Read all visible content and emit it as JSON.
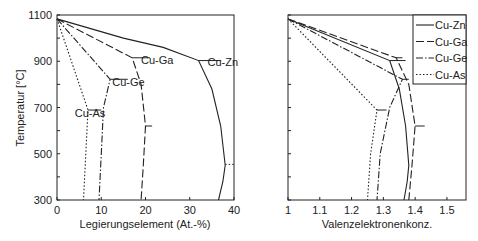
{
  "chart_data": [
    {
      "type": "line",
      "title": "",
      "xlabel": "Legierungselement (At.-%)",
      "ylabel": "Temperatur [°C]",
      "xlim": [
        0,
        40
      ],
      "ylim": [
        300,
        1100
      ],
      "xticks": [
        0,
        10,
        20,
        30,
        40
      ],
      "yticks": [
        300,
        500,
        700,
        900,
        1100
      ],
      "grid": false,
      "series": [
        {
          "name": "Cu-Zn",
          "style": "solid",
          "points": [
            [
              0,
              1083
            ],
            [
              15,
              1000
            ],
            [
              24,
              960
            ],
            [
              32,
              903
            ],
            [
              35,
              780
            ],
            [
              37,
              620
            ],
            [
              38,
              450
            ],
            [
              37.5,
              380
            ],
            [
              36.5,
              300
            ]
          ],
          "peritectic": {
            "x1": 32,
            "x2": 37,
            "y": 903
          },
          "eutectoid": {
            "x1": 38,
            "x2": 40,
            "y": 454
          }
        },
        {
          "name": "Cu-Ga",
          "style": "dashed",
          "points": [
            [
              0,
              1083
            ],
            [
              17,
              915
            ],
            [
              19,
              800
            ],
            [
              20,
              620
            ],
            [
              19.5,
              450
            ],
            [
              19,
              300
            ]
          ],
          "peritectic": {
            "x1": 17,
            "x2": 21,
            "y": 915
          },
          "eutectoid": {
            "x1": 20,
            "x2": 21.5,
            "y": 620
          }
        },
        {
          "name": "Cu-Ge",
          "style": "dashdot",
          "points": [
            [
              0,
              1083
            ],
            [
              12,
              822
            ],
            [
              10.5,
              700
            ],
            [
              10,
              500
            ],
            [
              9.5,
              300
            ]
          ],
          "peritectic": {
            "x1": 12,
            "x2": 16,
            "y": 822
          }
        },
        {
          "name": "Cu-As",
          "style": "dotted",
          "points": [
            [
              0,
              1083
            ],
            [
              7,
              689
            ],
            [
              6.5,
              500
            ],
            [
              6,
              300
            ]
          ],
          "peritectic": {
            "x1": 7,
            "x2": 10,
            "y": 689
          }
        }
      ],
      "annotations": [
        {
          "text": "Cu-Zn",
          "x": 34,
          "y": 880
        },
        {
          "text": "Cu-Ga",
          "x": 19,
          "y": 890
        },
        {
          "text": "Cu-Ge",
          "x": 12.5,
          "y": 795
        },
        {
          "text": "Cu-As",
          "x": 4,
          "y": 660
        }
      ]
    },
    {
      "type": "line",
      "title": "",
      "xlabel": "Valenzelektronenkonz.",
      "ylabel": "",
      "xlim": [
        1,
        1.56
      ],
      "ylim": [
        300,
        1100
      ],
      "xticks": [
        1,
        1.1,
        1.2,
        1.3,
        1.4,
        1.5
      ],
      "yticks": [
        300,
        400,
        500,
        600,
        700,
        800,
        900,
        1000,
        1100
      ],
      "grid": false,
      "legend": {
        "position": "upper right",
        "entries": [
          "Cu-Zn",
          "Cu-Ga",
          "Cu-Ge",
          "Cu-As"
        ]
      },
      "series": [
        {
          "name": "Cu-Zn",
          "style": "solid",
          "points": [
            [
              1,
              1083
            ],
            [
              1.32,
              903
            ],
            [
              1.35,
              780
            ],
            [
              1.37,
              620
            ],
            [
              1.38,
              450
            ],
            [
              1.375,
              380
            ],
            [
              1.365,
              300
            ]
          ],
          "peritectic": {
            "x1": 1.32,
            "x2": 1.37,
            "y": 903
          }
        },
        {
          "name": "Cu-Ga",
          "style": "dashed",
          "points": [
            [
              1,
              1083
            ],
            [
              1.34,
              915
            ],
            [
              1.38,
              800
            ],
            [
              1.4,
              620
            ],
            [
              1.39,
              450
            ],
            [
              1.38,
              300
            ]
          ],
          "peritectic": {
            "x1": 1.34,
            "x2": 1.36,
            "y": 915
          },
          "eutectoid": {
            "x1": 1.4,
            "x2": 1.43,
            "y": 620
          }
        },
        {
          "name": "Cu-Ge",
          "style": "dashdot",
          "points": [
            [
              1,
              1083
            ],
            [
              1.36,
              822
            ],
            [
              1.32,
              700
            ],
            [
              1.29,
              500
            ],
            [
              1.28,
              300
            ]
          ],
          "peritectic": {
            "x1": 1.36,
            "x2": 1.38,
            "y": 822
          }
        },
        {
          "name": "Cu-As",
          "style": "dotted",
          "points": [
            [
              1,
              1083
            ],
            [
              1.28,
              689
            ],
            [
              1.26,
              500
            ],
            [
              1.25,
              300
            ]
          ],
          "peritectic": {
            "x1": 1.28,
            "x2": 1.31,
            "y": 689
          }
        }
      ]
    }
  ]
}
